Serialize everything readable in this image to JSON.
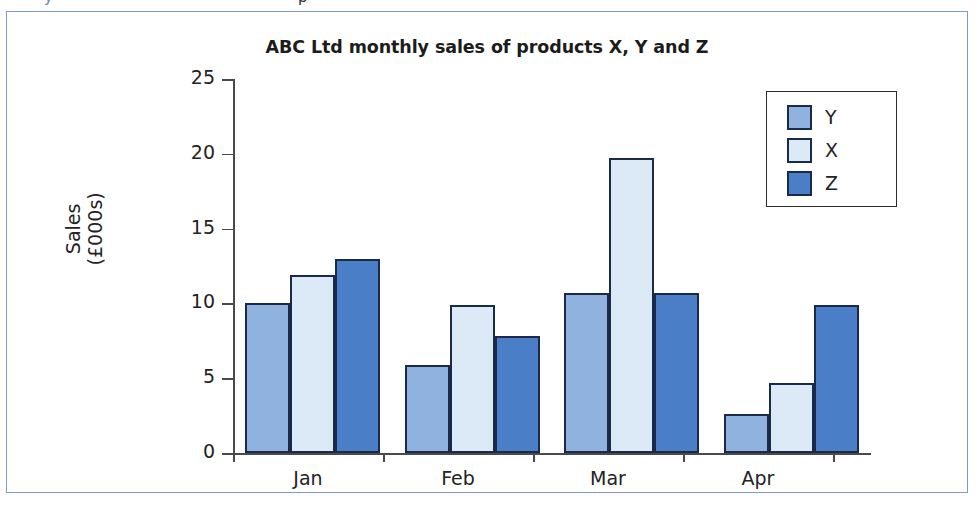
{
  "figure": {
    "frame_border_color": "#8099d2",
    "background": "#ffffff"
  },
  "top_remnant": {
    "glyph_left": "y",
    "glyph_mid": "p"
  },
  "chart_data": {
    "type": "bar",
    "title": "ABC Ltd monthly sales of products X, Y and Z",
    "xlabel": "",
    "ylabel": "Sales\n(£000s)",
    "ylabel_line1": "Sales",
    "ylabel_line2": "(£000s)",
    "categories": [
      "Jan",
      "Feb",
      "Mar",
      "Apr"
    ],
    "ylim": [
      0,
      25
    ],
    "yticks": [
      0,
      5,
      10,
      15,
      20,
      25
    ],
    "ytick_labels": [
      "0",
      "5",
      "10",
      "15",
      "20",
      "25"
    ],
    "grid": false,
    "legend_position": "upper right",
    "series": [
      {
        "name": "Y",
        "color": "#8fb2de",
        "edge_color": "#1b2a4a",
        "values": [
          10.0,
          5.9,
          10.7,
          2.6
        ]
      },
      {
        "name": "X",
        "color": "#dbeaf6",
        "edge_color": "#1b2a4a",
        "values": [
          11.9,
          9.9,
          19.7,
          4.7
        ]
      },
      {
        "name": "Z",
        "color": "#4a7fc8",
        "edge_color": "#1b2a4a",
        "values": [
          13.0,
          7.8,
          10.7,
          9.9
        ]
      }
    ]
  }
}
